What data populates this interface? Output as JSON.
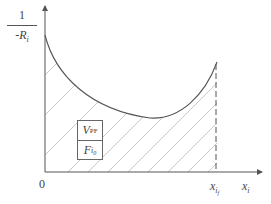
{
  "diagram": {
    "type": "area-under-curve",
    "y_axis_label": {
      "numerator": "1",
      "denominator_prefix": "-",
      "denominator_var": "R",
      "denominator_sub": "i"
    },
    "x_axis_label": {
      "var": "x",
      "sub": "i"
    },
    "origin_label": "0",
    "x_marker_label": {
      "var": "x",
      "sub": "i",
      "subsub": "f"
    },
    "box": {
      "top": {
        "var": "V",
        "sub": "PF"
      },
      "bottom": {
        "var": "F",
        "sub": "i",
        "subsub": "0"
      }
    },
    "colors": {
      "axis": "#555555",
      "curve": "#555555",
      "hatch": "#c8c8c8",
      "dashed_line": "#555555"
    }
  }
}
